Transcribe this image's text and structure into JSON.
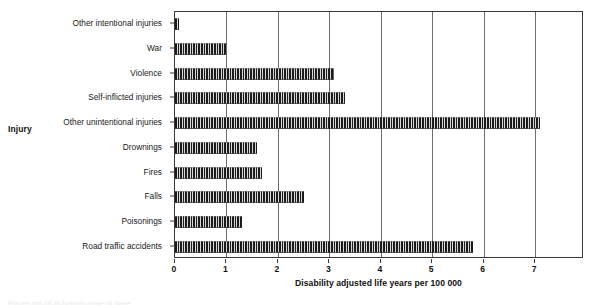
{
  "chart_data": {
    "type": "bar",
    "orientation": "horizontal",
    "title": "",
    "xlabel": "Disability adjusted life years per 100 000",
    "ylabel": "Injury",
    "xlim": [
      0,
      7.95
    ],
    "xticks": [
      0,
      1,
      2,
      3,
      4,
      5,
      6,
      7
    ],
    "xtick_labels": [
      "0",
      "1",
      "2",
      "3",
      "4",
      "5",
      "6",
      "7"
    ],
    "grid": "vertical gridlines at each integer tick",
    "legend": "none",
    "bar_fill": "vertical hatch (dark with thin light stripes)",
    "categories": [
      "Other intentional injuries",
      "War",
      "Violence",
      "Self-inflicted injuries",
      "Other unintentional injuries",
      "Drownings",
      "Fires",
      "Falls",
      "Poisonings",
      "Road traffic accidents"
    ],
    "values": [
      0.07,
      1.0,
      3.1,
      3.3,
      7.1,
      1.6,
      1.7,
      2.5,
      1.3,
      5.8
    ]
  },
  "colors": {
    "bar_dark": "#1c1c1c",
    "bar_light": "#d8d8d8",
    "axis": "#3a3a3a",
    "gridline": "#6e6e6e",
    "text": "#1a1a1a",
    "background": "#ffffff"
  },
  "caption": {
    "bottom_cutoff_text": "Figure cut off at bottom edge of page"
  }
}
